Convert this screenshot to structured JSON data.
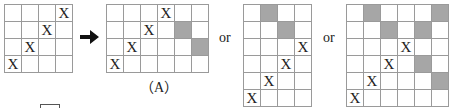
{
  "diagram": {
    "arrow_icon": "right-arrow",
    "label_a": "（A）",
    "or_label_1": "or",
    "or_label_2": "or",
    "colors": {
      "grid_line": "#9a9a9a",
      "shaded_cell": "#a6a6a6",
      "text": "#222222"
    },
    "grids": [
      {
        "id": "original",
        "rows": 4,
        "cols": 4,
        "marks": [
          [
            0,
            3,
            "X"
          ],
          [
            1,
            2,
            "X"
          ],
          [
            2,
            1,
            "X"
          ],
          [
            3,
            0,
            "X"
          ]
        ],
        "shaded": []
      },
      {
        "id": "option-a",
        "rows": 4,
        "cols": 6,
        "marks": [
          [
            0,
            3,
            "X"
          ],
          [
            1,
            2,
            "X"
          ],
          [
            2,
            1,
            "X"
          ],
          [
            3,
            0,
            "X"
          ]
        ],
        "shaded": [
          [
            1,
            4
          ],
          [
            2,
            5
          ]
        ]
      },
      {
        "id": "option-b",
        "rows": 6,
        "cols": 4,
        "marks": [
          [
            2,
            3,
            "X"
          ],
          [
            3,
            2,
            "X"
          ],
          [
            4,
            1,
            "X"
          ],
          [
            5,
            0,
            "X"
          ]
        ],
        "shaded": [
          [
            0,
            1
          ],
          [
            1,
            2
          ]
        ]
      },
      {
        "id": "option-c",
        "rows": 6,
        "cols": 6,
        "marks": [
          [
            2,
            3,
            "X"
          ],
          [
            3,
            2,
            "X"
          ],
          [
            4,
            1,
            "X"
          ],
          [
            5,
            0,
            "X"
          ]
        ],
        "shaded": [
          [
            0,
            1
          ],
          [
            0,
            5
          ],
          [
            1,
            2
          ],
          [
            1,
            4
          ],
          [
            3,
            4
          ],
          [
            4,
            5
          ]
        ]
      }
    ]
  }
}
